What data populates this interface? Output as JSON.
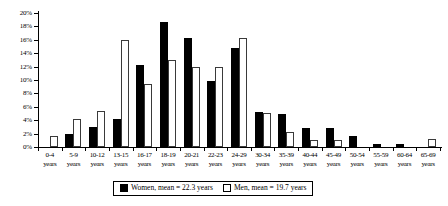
{
  "chart_data": {
    "type": "bar",
    "title": "",
    "subtitle": "",
    "xlabel": "",
    "ylabel": "",
    "ylim": [
      0,
      20
    ],
    "ytick_labels": [
      "20%",
      "18%",
      "16%",
      "14%",
      "12%",
      "10%",
      "8%",
      "6%",
      "4%",
      "2%",
      "0%"
    ],
    "ytick_values": [
      20,
      18,
      16,
      14,
      12,
      10,
      8,
      6,
      4,
      2,
      0
    ],
    "grid": false,
    "legend_position": "bottom-center",
    "categories": [
      "0-4 years",
      "5-9 years",
      "10-12 years",
      "13-15 years",
      "16-17 years",
      "18-19 years",
      "20-21 years",
      "22-23 years",
      "24-29 years",
      "30-34 years",
      "35-39 years",
      "40-44 years",
      "45-49 years",
      "50-54 years",
      "55-59 years",
      "60-64 years",
      "65-69 years"
    ],
    "category_lines": [
      [
        "0-4",
        "years"
      ],
      [
        "5-9",
        "years"
      ],
      [
        "10-12",
        "years"
      ],
      [
        "13-15",
        "years"
      ],
      [
        "16-17",
        "years"
      ],
      [
        "18-19",
        "years"
      ],
      [
        "20-21",
        "years"
      ],
      [
        "22-23",
        "years"
      ],
      [
        "24-29",
        "years"
      ],
      [
        "30-34",
        "years"
      ],
      [
        "35-39",
        "years"
      ],
      [
        "40-44",
        "years"
      ],
      [
        "45-49",
        "years"
      ],
      [
        "50-54",
        "years"
      ],
      [
        "55-59",
        "years"
      ],
      [
        "60-64",
        "years"
      ],
      [
        "65-69",
        "years"
      ]
    ],
    "series": [
      {
        "name": "Women, mean = 22.3 years",
        "short_name": "Women",
        "color": "#000000",
        "fill": "solid",
        "values": [
          0.0,
          2.0,
          3.0,
          4.2,
          12.2,
          18.7,
          16.3,
          9.8,
          14.8,
          5.2,
          5.0,
          2.9,
          2.9,
          1.7,
          0.4,
          0.5,
          0.0
        ]
      },
      {
        "name": "Men, mean = 19.7 years",
        "short_name": "Men",
        "color": "#ffffff",
        "fill": "hollow",
        "values": [
          1.6,
          4.2,
          5.4,
          16.0,
          9.4,
          13.0,
          11.9,
          11.9,
          16.2,
          5.1,
          2.3,
          1.0,
          1.1,
          0.0,
          0.0,
          0.0,
          1.2
        ]
      }
    ]
  },
  "legend": {
    "women_label": "Women, mean = 22.3 years",
    "men_label": "Men, mean = 19.7 years"
  }
}
